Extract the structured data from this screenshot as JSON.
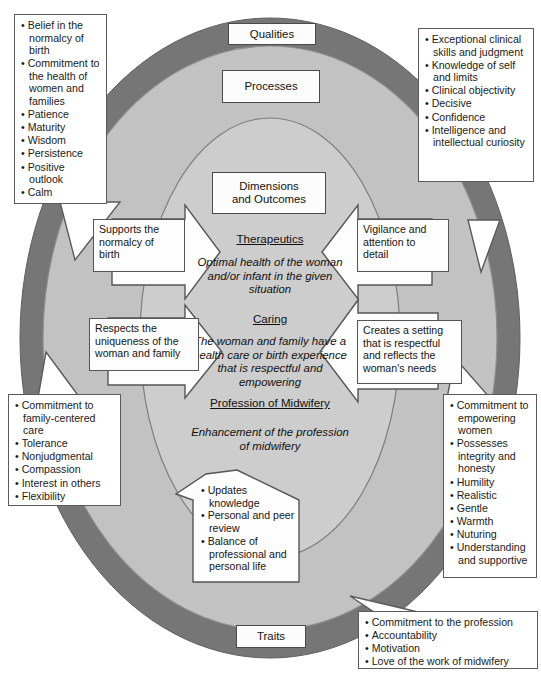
{
  "diagram": {
    "colors": {
      "outer_ring": "#767676",
      "middle_ring": "#c0c0c0",
      "inner_ellipse": "#cfcfcf",
      "box_fill": "#ffffff",
      "box_border": "#555555",
      "text": "#111111"
    },
    "ring_labels": {
      "outer": "Qualities",
      "middle": "Processes",
      "inner": "Dimensions\nand Outcomes",
      "bottom": "Traits"
    },
    "ring_label_qualities": "Qualities",
    "ring_label_processes": "Processes",
    "ring_label_dimensions_line1": "Dimensions",
    "ring_label_dimensions_line2": "and Outcomes",
    "ring_label_traits": "Traits"
  },
  "core": {
    "therapeutics": {
      "heading": "Therapeutics",
      "body_line1": "Optimal health of the woman",
      "body_line2": "and/or infant in the given",
      "body_line3": "situation"
    },
    "caring": {
      "heading": "Caring",
      "body_line1": "The woman and family have a",
      "body_line2": "health care or birth experience",
      "body_line3": "that is respectful and",
      "body_line4": "empowering"
    },
    "profession": {
      "heading": "Profession of Midwifery",
      "body_line1": "Enhancement of the profession",
      "body_line2": "of midwifery"
    }
  },
  "process_arrows": {
    "left_top": {
      "line1": "Supports the",
      "line2": "normalcy of",
      "line3": "birth"
    },
    "left_middle": {
      "line1": "Respects the",
      "line2": "uniqueness of the",
      "line3": "woman and family"
    },
    "right_top": {
      "line1": "Vigilance and",
      "line2": "attention to",
      "line3": "detail"
    },
    "right_middle": {
      "line1": "Creates a setting",
      "line2": "that is respectful",
      "line3": "and reflects the",
      "line4": "woman's needs"
    },
    "bottom": {
      "items": [
        "Updates knowledge",
        "Personal and peer review",
        "Balance of professional and personal life"
      ]
    }
  },
  "callouts": {
    "top_left": {
      "name": "qualities-top-left",
      "items": [
        "Belief in the normalcy of birth",
        "Commitment to the health of women and families",
        "Patience",
        "Maturity",
        "Wisdom",
        "Persistence",
        "Positive outlook",
        "Calm"
      ]
    },
    "top_right": {
      "name": "qualities-top-right",
      "items": [
        "Exceptional clinical skills and judgment",
        "Knowledge of self and limits",
        "Clinical objectivity",
        "Decisive",
        "Confidence",
        "Intelligence and intellectual curiosity"
      ]
    },
    "bottom_left": {
      "name": "traits-bottom-left",
      "items": [
        "Commitment to family-centered care",
        "Tolerance",
        "Nonjudgmental",
        "Compassion",
        "Interest in others",
        "Flexibility"
      ]
    },
    "bottom_right": {
      "name": "traits-bottom-right",
      "items": [
        "Commitment to empowering women",
        "Possesses integrity and honesty",
        "Humility",
        "Realistic",
        "Gentle",
        "Warmth",
        "Nuturing",
        "Understanding and supportive"
      ]
    },
    "bottom_center_right": {
      "name": "traits-bottom-center-right",
      "items": [
        "Commitment to the profession",
        "Accountability",
        "Motivation",
        "Love of the work of midwifery"
      ]
    }
  }
}
